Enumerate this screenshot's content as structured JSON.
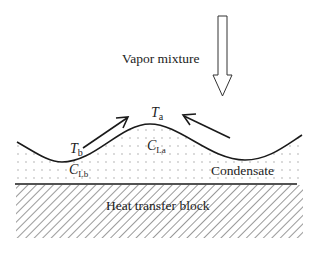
{
  "diagram": {
    "vapor_label": "Vapor mixture",
    "interface_temp_peak": {
      "symbol": "T",
      "subscript": "a"
    },
    "interface_temp_trough": {
      "symbol": "T",
      "subscript": "b"
    },
    "concentration_peak": {
      "symbol": "C",
      "subscript": "La"
    },
    "concentration_trough": {
      "symbol": "C",
      "subscript": "Lb"
    },
    "condensate_label": "Condensate",
    "block_label": "Heat transfer block"
  },
  "colors": {
    "stroke": "#1a1a1a",
    "hatch": "#555555",
    "dots": "#9a9a9a",
    "background": "#ffffff"
  }
}
